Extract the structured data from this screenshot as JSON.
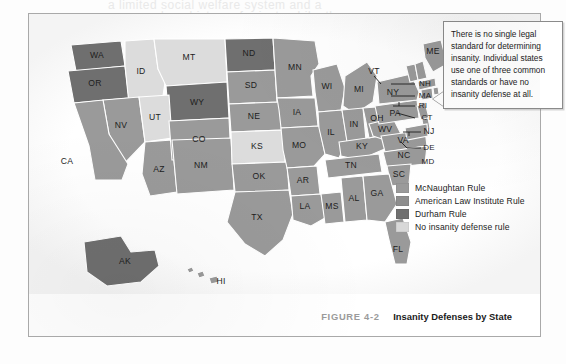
{
  "figure": {
    "number": "FIGURE 4-2",
    "title": "Insanity Defenses by State"
  },
  "callout": {
    "text": "There is no single legal standard for determining insanity. Individual states use one of three common standards or have no insanity defense at all."
  },
  "legend": {
    "items": [
      {
        "label": "McNaughtan Rule",
        "color": "#9a9a9a",
        "key": "mcnaughtan"
      },
      {
        "label": "American Law Institute Rule",
        "color": "#8e8e8e",
        "key": "ali"
      },
      {
        "label": "Durham Rule",
        "color": "#6f6f6f",
        "key": "durham"
      },
      {
        "label": "No insanity defense rule",
        "color": "#d8d8d8",
        "key": "none"
      }
    ]
  },
  "bleed": {
    "line1": "a limited social welfare system and a",
    "line2": "a long history of private philanthropy",
    "line3": "be court rul"
  },
  "map": {
    "palette": {
      "mcnaughtan": "#9a9a9a",
      "ali": "#8e8e8e",
      "durham": "#6f6f6f",
      "none": "#dcdcdc",
      "light": "#d2d2d2"
    },
    "states": [
      {
        "abbr": "WA",
        "rule": "durham"
      },
      {
        "abbr": "OR",
        "rule": "durham"
      },
      {
        "abbr": "ID",
        "rule": "none"
      },
      {
        "abbr": "MT",
        "rule": "none"
      },
      {
        "abbr": "WY",
        "rule": "durham"
      },
      {
        "abbr": "NV",
        "rule": "mcnaughtan"
      },
      {
        "abbr": "UT",
        "rule": "none"
      },
      {
        "abbr": "CA",
        "rule": "mcnaughtan"
      },
      {
        "abbr": "AZ",
        "rule": "mcnaughtan"
      },
      {
        "abbr": "CO",
        "rule": "mcnaughtan"
      },
      {
        "abbr": "NM",
        "rule": "mcnaughtan"
      },
      {
        "abbr": "ND",
        "rule": "durham"
      },
      {
        "abbr": "SD",
        "rule": "mcnaughtan"
      },
      {
        "abbr": "NE",
        "rule": "mcnaughtan"
      },
      {
        "abbr": "KS",
        "rule": "none"
      },
      {
        "abbr": "OK",
        "rule": "mcnaughtan"
      },
      {
        "abbr": "TX",
        "rule": "mcnaughtan"
      },
      {
        "abbr": "MN",
        "rule": "mcnaughtan"
      },
      {
        "abbr": "IA",
        "rule": "mcnaughtan"
      },
      {
        "abbr": "MO",
        "rule": "mcnaughtan"
      },
      {
        "abbr": "AR",
        "rule": "mcnaughtan"
      },
      {
        "abbr": "LA",
        "rule": "mcnaughtan"
      },
      {
        "abbr": "WI",
        "rule": "mcnaughtan"
      },
      {
        "abbr": "IL",
        "rule": "mcnaughtan"
      },
      {
        "abbr": "MS",
        "rule": "mcnaughtan"
      },
      {
        "abbr": "MI",
        "rule": "mcnaughtan"
      },
      {
        "abbr": "IN",
        "rule": "mcnaughtan"
      },
      {
        "abbr": "KY",
        "rule": "mcnaughtan"
      },
      {
        "abbr": "TN",
        "rule": "mcnaughtan"
      },
      {
        "abbr": "AL",
        "rule": "mcnaughtan"
      },
      {
        "abbr": "OH",
        "rule": "mcnaughtan"
      },
      {
        "abbr": "WV",
        "rule": "mcnaughtan"
      },
      {
        "abbr": "VA",
        "rule": "mcnaughtan"
      },
      {
        "abbr": "NC",
        "rule": "mcnaughtan"
      },
      {
        "abbr": "SC",
        "rule": "mcnaughtan"
      },
      {
        "abbr": "GA",
        "rule": "mcnaughtan"
      },
      {
        "abbr": "FL",
        "rule": "mcnaughtan"
      },
      {
        "abbr": "PA",
        "rule": "mcnaughtan"
      },
      {
        "abbr": "NY",
        "rule": "mcnaughtan"
      },
      {
        "abbr": "VT",
        "rule": "mcnaughtan"
      },
      {
        "abbr": "ME",
        "rule": "mcnaughtan"
      },
      {
        "abbr": "NH",
        "rule": "mcnaughtan"
      },
      {
        "abbr": "MA",
        "rule": "mcnaughtan"
      },
      {
        "abbr": "RI",
        "rule": "mcnaughtan"
      },
      {
        "abbr": "CT",
        "rule": "mcnaughtan"
      },
      {
        "abbr": "NJ",
        "rule": "mcnaughtan"
      },
      {
        "abbr": "DE",
        "rule": "mcnaughtan"
      },
      {
        "abbr": "MD",
        "rule": "mcnaughtan"
      },
      {
        "abbr": "AK",
        "rule": "durham"
      },
      {
        "abbr": "HI",
        "rule": "mcnaughtan"
      }
    ],
    "labels": {
      "WA": "WA",
      "OR": "OR",
      "ID": "ID",
      "MT": "MT",
      "WY": "WY",
      "NV": "NV",
      "UT": "UT",
      "CA": "CA",
      "AZ": "AZ",
      "CO": "CO",
      "NM": "NM",
      "ND": "ND",
      "SD": "SD",
      "NE": "NE",
      "KS": "KS",
      "OK": "OK",
      "TX": "TX",
      "MN": "MN",
      "IA": "IA",
      "MO": "MO",
      "AR": "AR",
      "LA": "LA",
      "WI": "WI",
      "IL": "IL",
      "MS": "MS",
      "MI": "MI",
      "IN": "IN",
      "KY": "KY",
      "TN": "TN",
      "AL": "AL",
      "OH": "OH",
      "WV": "WV",
      "VA": "VA",
      "NC": "NC",
      "SC": "SC",
      "GA": "GA",
      "FL": "FL",
      "PA": "PA",
      "NY": "NY",
      "VT": "VT",
      "ME": "ME",
      "NH": "NH",
      "MA": "MA",
      "RI": "RI",
      "CT": "CT",
      "NJ": "NJ",
      "DE": "DE",
      "MD": "MD",
      "AK": "AK",
      "HI": "HI"
    }
  }
}
